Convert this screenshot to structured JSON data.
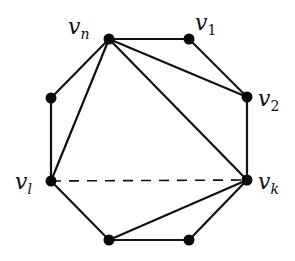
{
  "diagram": {
    "colors": {
      "stroke": "#111111",
      "vertex": "#0a0a0a",
      "background": "#ffffff"
    },
    "vertices": [
      {
        "id": "vn",
        "x": 109,
        "y": 39,
        "label": "v",
        "subscript": "n"
      },
      {
        "id": "v1",
        "x": 189,
        "y": 39,
        "label": "v",
        "subscript": "1"
      },
      {
        "id": "v2",
        "x": 247,
        "y": 97,
        "label": "v",
        "subscript": "2"
      },
      {
        "id": "vk",
        "x": 247,
        "y": 180,
        "label": "v",
        "subscript": "k"
      },
      {
        "id": "br",
        "x": 189,
        "y": 240,
        "label": "",
        "subscript": ""
      },
      {
        "id": "bl",
        "x": 109,
        "y": 240,
        "label": "",
        "subscript": ""
      },
      {
        "id": "vl",
        "x": 51,
        "y": 181,
        "label": "v",
        "subscript": "l"
      },
      {
        "id": "ul",
        "x": 51,
        "y": 98,
        "label": "",
        "subscript": ""
      }
    ],
    "polygon_edges": [
      [
        "vn",
        "v1"
      ],
      [
        "v1",
        "v2"
      ],
      [
        "v2",
        "vk"
      ],
      [
        "vk",
        "br"
      ],
      [
        "br",
        "bl"
      ],
      [
        "bl",
        "vl"
      ],
      [
        "vl",
        "ul"
      ],
      [
        "ul",
        "vn"
      ]
    ],
    "diagonals": [
      [
        "vn",
        "vl"
      ],
      [
        "vn",
        "vk"
      ],
      [
        "vn",
        "v2"
      ],
      [
        "bl",
        "vk"
      ]
    ],
    "dashed_edges": [
      [
        "vl",
        "vk"
      ]
    ],
    "labels": {
      "vn": {
        "text": "v",
        "sub": "n"
      },
      "v1": {
        "text": "v",
        "sub": "1"
      },
      "v2": {
        "text": "v",
        "sub": "2"
      },
      "vl": {
        "text": "v",
        "sub": "l"
      },
      "vk": {
        "text": "v",
        "sub": "k"
      }
    }
  }
}
